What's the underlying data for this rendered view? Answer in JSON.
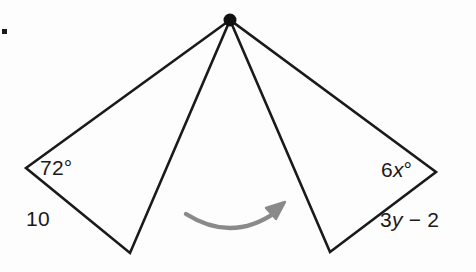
{
  "figure": {
    "type": "geometry-diagram",
    "background_color": "#fdfdfd",
    "stroke_color": "#1a1a1a",
    "arrow_color": "#8a8a8a",
    "apex_dot_color": "#111111",
    "vertices": {
      "apex": {
        "x": 230,
        "y": 20
      },
      "left_outer": {
        "x": 26,
        "y": 168
      },
      "left_bottom": {
        "x": 130,
        "y": 253
      },
      "right_bottom": {
        "x": 330,
        "y": 252
      },
      "right_outer": {
        "x": 436,
        "y": 172
      }
    },
    "edges": [
      {
        "name": "apex-to-left-outer",
        "from": "apex",
        "to": "left_outer"
      },
      {
        "name": "left-outer-to-left-bottom",
        "from": "left_outer",
        "to": "left_bottom"
      },
      {
        "name": "left-bottom-to-apex",
        "from": "left_bottom",
        "to": "apex"
      },
      {
        "name": "apex-to-right-bottom",
        "from": "apex",
        "to": "right_bottom"
      },
      {
        "name": "right-bottom-to-right-outer",
        "from": "right_bottom",
        "to": "right_outer"
      },
      {
        "name": "right-outer-to-apex",
        "from": "right_outer",
        "to": "apex"
      }
    ],
    "labels": {
      "left_angle": "72°",
      "left_side": "10",
      "right_angle_coefficient": "6",
      "right_angle_variable": "x",
      "right_angle_degree": "°",
      "right_side_term": "3",
      "right_side_variable": "y",
      "right_side_rest": " − 2"
    },
    "arrow": {
      "name": "correspondence-arrow",
      "direction": "left-to-right",
      "start": {
        "x": 186,
        "y": 214
      },
      "end": {
        "x": 282,
        "y": 208
      }
    }
  }
}
